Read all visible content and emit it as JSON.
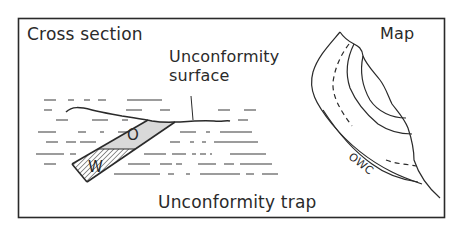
{
  "figure": {
    "title": "Unconformity trap",
    "panels": {
      "cross_section": {
        "label": "Cross section",
        "annotation": "Unconformity surface",
        "zones": [
          {
            "label": "O",
            "meaning": "oil",
            "fill": "#d9d9d9"
          },
          {
            "label": "W",
            "meaning": "water",
            "fill": "hatched"
          }
        ]
      },
      "map": {
        "label": "Map",
        "contact_label": "OWC"
      }
    },
    "colors": {
      "line": "#2a2a2a",
      "oil_fill": "#d9d9d9",
      "background": "#ffffff"
    }
  }
}
